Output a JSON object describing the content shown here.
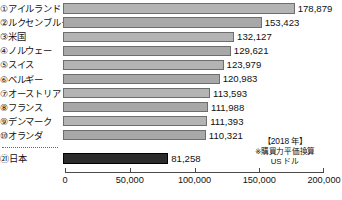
{
  "chart_data": {
    "type": "bar",
    "orientation": "horizontal",
    "title": "",
    "xlabel": "",
    "ylabel": "",
    "xlim": [
      0,
      200000
    ],
    "xticks": [
      0,
      50000,
      100000,
      150000,
      200000
    ],
    "xtick_labels": [
      "0",
      "50,000",
      "100,000",
      "150,000",
      "200,000"
    ],
    "grid": false,
    "legend": false,
    "annotation_year": "【2018 年】",
    "annotation_note": "※購買力平価換算",
    "annotation_unit": "US ドル",
    "separator_after_index": 9,
    "categories": [
      "アイルランド",
      "ルクセンブルク",
      "米国",
      "ノルウェー",
      "スイス",
      "ベルギー",
      "オーストリア",
      "フランス",
      "デンマーク",
      "オランダ",
      "日本"
    ],
    "ranks": [
      "①",
      "②",
      "③",
      "④",
      "⑤",
      "⑥",
      "⑦",
      "⑧",
      "⑨",
      "⑩",
      "㉑"
    ],
    "values": [
      178879,
      153423,
      132127,
      129621,
      123979,
      120983,
      113593,
      111988,
      111393,
      110321,
      81258
    ],
    "value_labels": [
      "178,879",
      "153,423",
      "132,127",
      "129,621",
      "123,979",
      "120,983",
      "113,593",
      "111,988",
      "111,393",
      "110,321",
      "81,258"
    ],
    "highlight_index": 10,
    "colors": {
      "bar": "#b4b4b4",
      "bar_alt": "#a8a8a8",
      "bar_border": "#6e6e6e",
      "highlight_bar": "#2b2b2b",
      "highlight_border": "#000000",
      "text": "#111111",
      "axis": "#4a4a4a",
      "background": "#ffffff"
    }
  }
}
